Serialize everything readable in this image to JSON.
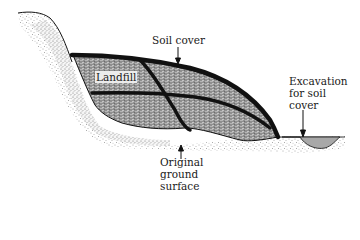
{
  "diagram": {
    "labels": {
      "soil_cover": "Soil cover",
      "landfill": "Landfill",
      "excavation_line1": "Excavation",
      "excavation_line2": "for soil",
      "excavation_line3": "cover",
      "ground_line1": "Original",
      "ground_line2": "ground",
      "ground_line3": "surface"
    },
    "colors": {
      "landfill_fill": "#9a9a9a",
      "cover_stroke": "#111111",
      "soil_stipple": "#6a6a6a",
      "excavation_fill": "#a8a8a8",
      "background": "#ffffff"
    }
  }
}
